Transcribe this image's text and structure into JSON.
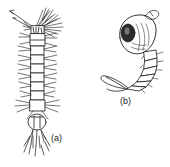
{
  "figure": {
    "type": "scientific-line-drawing",
    "background_color": "#ffffff",
    "ink_color": "#1a1a1a",
    "panels": [
      {
        "key": "a",
        "label": "(a)",
        "name": "mosquito-larva",
        "orientation": "vertical, head at top",
        "features": [
          "mouth brushes",
          "antennae",
          "head",
          "thorax",
          "segmented abdomen",
          "lateral hair tufts",
          "siphon",
          "anal gills"
        ]
      },
      {
        "key": "b",
        "label": "(b)",
        "name": "mosquito-pupa",
        "orientation": "comma shaped, head upper right",
        "features": [
          "cephalothorax",
          "compound eye",
          "respiratory trumpet",
          "curved abdomen",
          "terminal paddles"
        ]
      }
    ]
  }
}
